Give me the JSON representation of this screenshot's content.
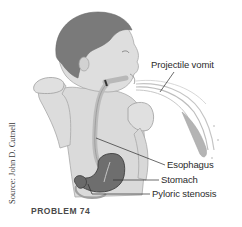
{
  "figure": {
    "problem_label": "PROBLEM 74",
    "source_credit": "Source: John D. Cutnell",
    "labels": {
      "projectile_vomit": "Projectile vomit",
      "esophagus": "Esophagus",
      "stomach": "Stomach",
      "pyloric_stenosis": "Pyloric stenosis"
    },
    "colors": {
      "skin": "#d9d9d9",
      "hair": "#7a7a7a",
      "stomach": "#6e6e6e",
      "esophagus": "#bfbfbf",
      "outline": "#9a9a9a",
      "leader_line": "#2b2b2b",
      "text": "#2b2b2b"
    }
  }
}
